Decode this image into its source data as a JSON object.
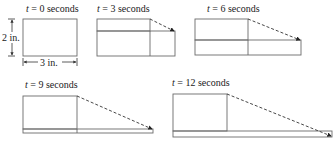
{
  "figure": {
    "panels": [
      {
        "id": "t0",
        "t_label": "t",
        "eq_label": " = 0 seconds"
      },
      {
        "id": "t3",
        "t_label": "t",
        "eq_label": " = 3 seconds"
      },
      {
        "id": "t6",
        "t_label": "t",
        "eq_label": " = 6 seconds"
      },
      {
        "id": "t9",
        "t_label": "t",
        "eq_label": " = 9 seconds"
      },
      {
        "id": "t12",
        "t_label": "t",
        "eq_label": " = 12 seconds"
      }
    ],
    "dimensions": {
      "height_label": "2 in.",
      "width_label": "3 in."
    }
  }
}
